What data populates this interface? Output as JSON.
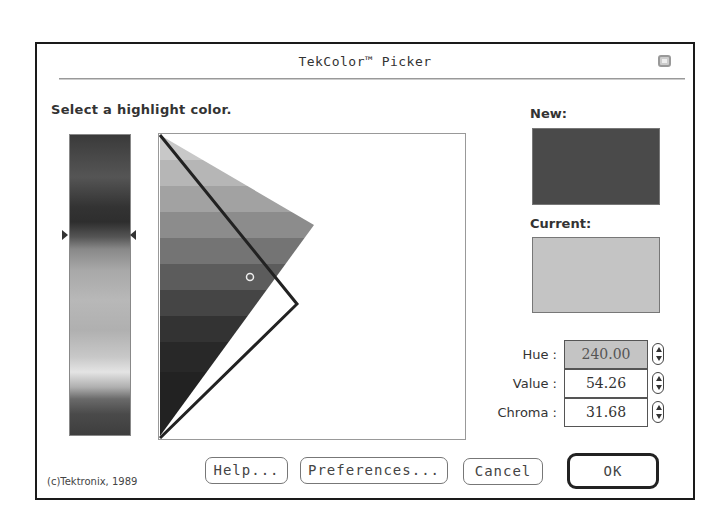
{
  "dialog": {
    "title": "TekColor™ Picker",
    "prompt": "Select a highlight color.",
    "copyright": "(c)Tektronix, 1989"
  },
  "swatches": {
    "new_label": "New:",
    "new_color": "#4a4a4a",
    "current_label": "Current:",
    "current_color": "#c4c4c4"
  },
  "fields": [
    {
      "label": "Hue :",
      "value": "240.00",
      "selected": true
    },
    {
      "label": "Value :",
      "value": "54.26",
      "selected": false
    },
    {
      "label": "Chroma :",
      "value": "31.68",
      "selected": false
    }
  ],
  "buttons": {
    "help": "Help...",
    "preferences": "Preferences...",
    "cancel": "Cancel",
    "ok": "OK"
  },
  "icons": {
    "close": "close-box-icon",
    "hue_marker": "triangle-marker-icon",
    "stepper": "up-down-arrows-icon",
    "selection": "ring-icon"
  }
}
